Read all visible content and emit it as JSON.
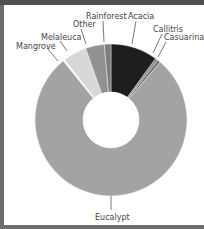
{
  "chart_data": {
    "type": "pie",
    "subtype": "donut",
    "title": "",
    "categories": [
      "Acacia",
      "Callitris",
      "Casuarina",
      "Eucalypt",
      "Mangrove",
      "Melaleuca",
      "Other",
      "Rainforest"
    ],
    "values": [
      10,
      0.6,
      0.6,
      78,
      0.4,
      5,
      4,
      1.4
    ],
    "unit": "%",
    "colors": [
      "#1e1e1e",
      "#8a8a8a",
      "#6a6a6a",
      "#a3a3a3",
      "#ffffff",
      "#d8d8d8",
      "#929292",
      "#7d7d7d"
    ],
    "start_angle_deg": 0,
    "direction": "clockwise",
    "legend": "none (leader-line labels)",
    "grid": false
  },
  "labels": {
    "acacia": "Acacia",
    "callitris": "Callitris",
    "casuarina": "Casuarina",
    "eucalypt": "Eucalypt",
    "mangrove": "Mangrove",
    "melaleuca": "Melaleuca",
    "other": "Other",
    "rainforest": "Rainforest"
  },
  "colors": {
    "frame_border": "#6e6e6e",
    "top_band": "#505050",
    "background": "#ffffff"
  }
}
